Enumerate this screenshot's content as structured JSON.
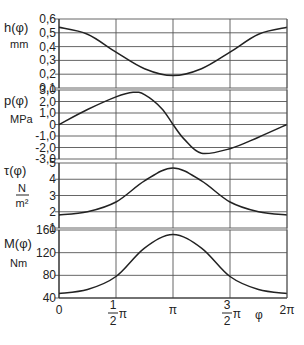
{
  "chart_data": [
    {
      "type": "line",
      "panel": "h",
      "ylabel": "h(φ)",
      "yunit": "mm",
      "yticks": [
        "0,6",
        "0,5",
        "0,4",
        "0,3",
        "0,2",
        "0,1"
      ],
      "ytick_values": [
        0.6,
        0.5,
        0.4,
        0.3,
        0.2,
        0.1
      ],
      "ylim": [
        0.1,
        0.6
      ],
      "x": [
        0,
        0.25,
        0.5,
        0.75,
        1.0,
        1.25,
        1.5,
        1.75,
        2.0
      ],
      "x_unit": "π",
      "values": [
        0.54,
        0.49,
        0.36,
        0.24,
        0.19,
        0.24,
        0.36,
        0.49,
        0.54
      ]
    },
    {
      "type": "line",
      "panel": "p",
      "ylabel": "p(φ)",
      "yunit": "MPa",
      "yticks": [
        "3,0",
        "2,0",
        "1,0",
        "0",
        "-1,0",
        "-2,0",
        "-3,0"
      ],
      "ytick_values": [
        3,
        2,
        1,
        0,
        -1,
        -2,
        -3
      ],
      "ylim": [
        -3,
        3
      ],
      "x": [
        0,
        0.25,
        0.5,
        0.65,
        0.75,
        0.9,
        1.0,
        1.1,
        1.25,
        1.5,
        1.75,
        2.0
      ],
      "x_unit": "π",
      "values": [
        0,
        1.3,
        2.4,
        2.8,
        2.6,
        1.4,
        0,
        -1.3,
        -2.5,
        -2.1,
        -1.1,
        0
      ]
    },
    {
      "type": "line",
      "panel": "tau",
      "ylabel": "τ(φ)",
      "yunit_num": "N",
      "yunit_den": "m²",
      "yticks": [
        "5",
        "4",
        "3",
        "2",
        "1"
      ],
      "ytick_values": [
        5,
        4,
        3,
        2,
        1
      ],
      "ylim": [
        1,
        5
      ],
      "x": [
        0,
        0.25,
        0.5,
        0.75,
        1.0,
        1.25,
        1.5,
        1.75,
        2.0
      ],
      "x_unit": "π",
      "values": [
        1.8,
        2.0,
        2.6,
        3.9,
        4.7,
        3.9,
        2.6,
        2.0,
        1.8
      ]
    },
    {
      "type": "line",
      "panel": "M",
      "ylabel": "M(φ)",
      "yunit": "Nm",
      "yticks": [
        "160",
        "120",
        "80",
        "40"
      ],
      "ytick_values": [
        160,
        120,
        80,
        40
      ],
      "ylim": [
        40,
        160
      ],
      "x": [
        0,
        0.25,
        0.5,
        0.75,
        1.0,
        1.25,
        1.5,
        1.75,
        2.0
      ],
      "x_unit": "π",
      "values": [
        48,
        55,
        78,
        128,
        152,
        128,
        78,
        55,
        48
      ]
    }
  ],
  "x_axis": {
    "label": "φ",
    "ticks": [
      {
        "value": 0,
        "label": "0"
      },
      {
        "value": 0.5,
        "num": "1",
        "den": "2",
        "suffix": "π"
      },
      {
        "value": 1.0,
        "label": "π"
      },
      {
        "value": 1.5,
        "num": "3",
        "den": "2",
        "suffix": "π"
      },
      {
        "value": 2.0,
        "label": "2π"
      }
    ],
    "xlim": [
      0,
      2
    ]
  },
  "layout": {
    "plot_left": 59,
    "plot_right": 287,
    "panels": [
      {
        "top": 19,
        "bottom": 88
      },
      {
        "top": 90,
        "bottom": 159
      },
      {
        "top": 163,
        "bottom": 228
      },
      {
        "top": 230,
        "bottom": 298
      }
    ],
    "line_color": "#222222",
    "grid_color": "#555555"
  }
}
